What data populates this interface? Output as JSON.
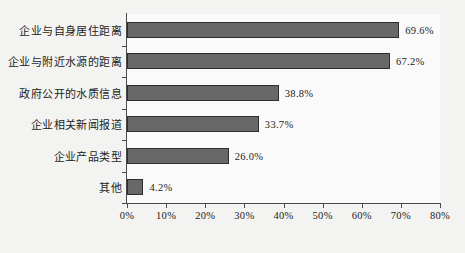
{
  "chart_data": {
    "type": "bar",
    "orientation": "horizontal",
    "title": "",
    "subtitle": "",
    "xlabel": "",
    "ylabel": "",
    "categories": [
      "企业与自身居住距离",
      "企业与附近水源的距离",
      "政府公开的水质信息",
      "企业相关新闻报道",
      "企业产品类型",
      "其他"
    ],
    "values": [
      69.6,
      67.2,
      38.8,
      33.7,
      26.0,
      4.2
    ],
    "value_labels": [
      "69.6%",
      "67.2%",
      "38.8%",
      "33.7%",
      "26.0%",
      "4.2%"
    ],
    "xlim": [
      0,
      80
    ],
    "xticks": [
      0,
      10,
      20,
      30,
      40,
      50,
      60,
      70,
      80
    ],
    "xtick_labels": [
      "0%",
      "10%",
      "20%",
      "30%",
      "40%",
      "50%",
      "60%",
      "70%",
      "80%"
    ],
    "grid": false,
    "legend": false,
    "legend_position": "none",
    "bar_color": "#686868",
    "bar_border_color": "#2e2e2e",
    "axis_color": "#4a4a4a",
    "text_color": "#1c1c1c",
    "background_color": "#f3f3f1",
    "plot_background_color": "#fafafa"
  }
}
